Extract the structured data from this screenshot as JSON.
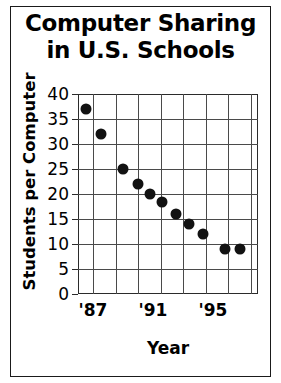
{
  "chart_data": {
    "type": "scatter",
    "title": "Computer Sharing in U.S. Schools",
    "title_lines": [
      "Computer Sharing",
      "in U.S. Schools"
    ],
    "xlabel": "Year",
    "ylabel": "Students per Computer",
    "ylim": [
      0,
      40
    ],
    "xlim": [
      1986,
      1998
    ],
    "ytick_labels": [
      "0",
      "5",
      "10",
      "15",
      "20",
      "25",
      "30",
      "35",
      "40"
    ],
    "ytick_values": [
      0,
      5,
      10,
      15,
      20,
      25,
      30,
      35,
      40
    ],
    "xtick_labels": [
      "'87",
      "'91",
      "'95"
    ],
    "xtick_values": [
      1987,
      1991,
      1995
    ],
    "grid": true,
    "legend": "none",
    "x": [
      1986.5,
      1987.5,
      1989,
      1990,
      1990.8,
      1991.6,
      1992.5,
      1993.4,
      1994.3,
      1995.8,
      1996.8
    ],
    "values": [
      37,
      32,
      25,
      22,
      20,
      18.5,
      16,
      14,
      12,
      9,
      9
    ],
    "points": [
      {
        "year": 1986.5,
        "students_per_computer": 37
      },
      {
        "year": 1987.5,
        "students_per_computer": 32
      },
      {
        "year": 1989.0,
        "students_per_computer": 25
      },
      {
        "year": 1990.0,
        "students_per_computer": 22
      },
      {
        "year": 1990.8,
        "students_per_computer": 20
      },
      {
        "year": 1991.6,
        "students_per_computer": 18.5
      },
      {
        "year": 1992.5,
        "students_per_computer": 16
      },
      {
        "year": 1993.4,
        "students_per_computer": 14
      },
      {
        "year": 1994.3,
        "students_per_computer": 12
      },
      {
        "year": 1995.8,
        "students_per_computer": 9
      },
      {
        "year": 1996.8,
        "students_per_computer": 9
      }
    ],
    "colors": {
      "marker": "#121212",
      "grid": "#4a4a4a",
      "axis": "#2b2b2b",
      "text": "#000000",
      "background": "#ffffff"
    }
  }
}
